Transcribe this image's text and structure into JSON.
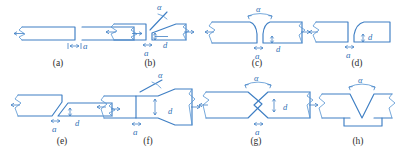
{
  "figure": {
    "line_color": "#3f7fc4",
    "caption_color": "#2b2b2b",
    "background": "#ffffff",
    "rows": 2,
    "columns": 4
  },
  "symbols": {
    "alpha": "α",
    "gap": "a",
    "root_face": "d"
  },
  "panels": [
    {
      "id": "a",
      "caption": "(a)",
      "type": "square-butt-joint",
      "labels": {
        "gap": "a"
      },
      "has_alpha": false,
      "has_root_face": false
    },
    {
      "id": "b",
      "caption": "(b)",
      "type": "single-bevel-groove",
      "labels": {
        "alpha": "α",
        "gap": "a",
        "root_face": "d"
      },
      "has_alpha": true,
      "has_root_face": true
    },
    {
      "id": "c",
      "caption": "(c)",
      "type": "single-u-groove",
      "labels": {
        "alpha": "α",
        "gap": "a",
        "root_face": "d"
      },
      "has_alpha": true,
      "has_root_face": true
    },
    {
      "id": "d",
      "caption": "(d)",
      "type": "single-j-groove",
      "labels": {
        "gap": "a",
        "root_face": "d"
      },
      "has_alpha": false,
      "has_root_face": true
    },
    {
      "id": "e",
      "caption": "(e)",
      "type": "double-bevel-groove",
      "labels": {
        "gap": "a",
        "root_face": "d"
      },
      "has_alpha": false,
      "has_root_face": true
    },
    {
      "id": "f",
      "caption": "(f)",
      "type": "single-v-groove-square-mating",
      "labels": {
        "alpha": "α",
        "gap": "a",
        "root_face": "d"
      },
      "has_alpha": true,
      "has_root_face": true
    },
    {
      "id": "g",
      "caption": "(g)",
      "type": "double-v-groove",
      "labels": {
        "alpha": "α",
        "gap": "a",
        "root_face": "d"
      },
      "has_alpha": true,
      "has_root_face": true
    },
    {
      "id": "h",
      "caption": "(h)",
      "type": "single-v-groove-with-backing-strip",
      "labels": {
        "alpha": "α"
      },
      "has_alpha": true,
      "has_root_face": false
    }
  ]
}
